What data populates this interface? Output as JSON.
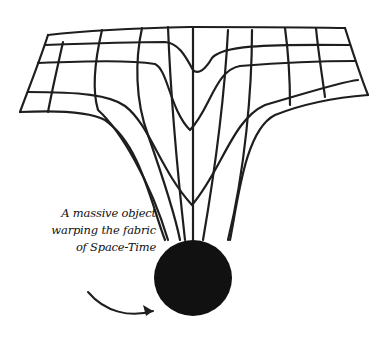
{
  "diagram": {
    "caption": {
      "lines": [
        "A massive object",
        "warping the fabric",
        "of Space-Time"
      ]
    },
    "elements": {
      "fabric": "warped-grid",
      "mass": "black-sphere",
      "pointer": "curved-arrow"
    },
    "colors": {
      "ink": "#1e1e1e",
      "mass": "#111111",
      "background": "#ffffff"
    }
  }
}
